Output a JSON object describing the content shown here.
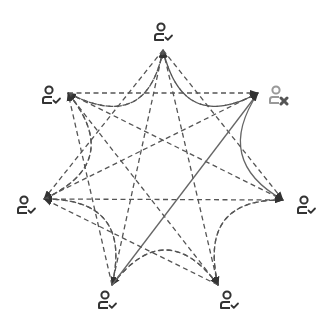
{
  "diagram": {
    "type": "network-graph",
    "colors": {
      "background": "#ffffff",
      "edge_dashed": "#555555",
      "edge_solid": "#666666",
      "node_icon": "#333333",
      "node_icon_disconnected": "#999999",
      "disconnect_mark": "#555555"
    },
    "nodes": [
      {
        "id": "n0",
        "icon": "user-check-icon",
        "status": "connected",
        "x": 163,
        "y": 32,
        "tip": [
          163,
          50
        ]
      },
      {
        "id": "n1",
        "icon": "user-x-icon",
        "status": "disconnected",
        "x": 278,
        "y": 95,
        "tip": [
          258,
          93
        ]
      },
      {
        "id": "n2",
        "icon": "user-check-icon",
        "status": "connected",
        "x": 306,
        "y": 205,
        "tip": [
          283,
          200
        ]
      },
      {
        "id": "n3",
        "icon": "user-check-icon",
        "status": "connected",
        "x": 229,
        "y": 300,
        "tip": [
          218,
          285
        ]
      },
      {
        "id": "n4",
        "icon": "user-check-icon",
        "status": "connected",
        "x": 107,
        "y": 300,
        "tip": [
          112,
          285
        ]
      },
      {
        "id": "n5",
        "icon": "user-check-icon",
        "status": "connected",
        "x": 26,
        "y": 205,
        "tip": [
          44,
          199
        ]
      },
      {
        "id": "n6",
        "icon": "user-check-icon",
        "status": "connected",
        "x": 51,
        "y": 95,
        "tip": [
          68,
          93
        ]
      }
    ],
    "edges": [
      {
        "from": "n0",
        "to": "n1",
        "style": "dashed",
        "shape": "curve"
      },
      {
        "from": "n1",
        "to": "n0",
        "style": "dashed",
        "shape": "curve"
      },
      {
        "from": "n6",
        "to": "n0",
        "style": "dashed",
        "shape": "curve"
      },
      {
        "from": "n0",
        "to": "n6",
        "style": "dashed",
        "shape": "curve"
      },
      {
        "from": "n6",
        "to": "n5",
        "style": "dashed",
        "shape": "curve"
      },
      {
        "from": "n5",
        "to": "n6",
        "style": "dashed",
        "shape": "curve"
      },
      {
        "from": "n5",
        "to": "n4",
        "style": "dashed",
        "shape": "curve"
      },
      {
        "from": "n4",
        "to": "n5",
        "style": "dashed",
        "shape": "curve"
      },
      {
        "from": "n4",
        "to": "n3",
        "style": "dashed",
        "shape": "curve"
      },
      {
        "from": "n3",
        "to": "n4",
        "style": "dashed",
        "shape": "curve"
      },
      {
        "from": "n3",
        "to": "n2",
        "style": "dashed",
        "shape": "curve"
      },
      {
        "from": "n2",
        "to": "n3",
        "style": "dashed",
        "shape": "curve"
      },
      {
        "from": "n1",
        "to": "n2",
        "style": "solid",
        "shape": "curve"
      },
      {
        "from": "n0",
        "to": "n2",
        "style": "dashed",
        "shape": "straight"
      },
      {
        "from": "n0",
        "to": "n5",
        "style": "dashed",
        "shape": "straight"
      },
      {
        "from": "n0",
        "to": "n3",
        "style": "dashed",
        "shape": "straight"
      },
      {
        "from": "n0",
        "to": "n4",
        "style": "dashed",
        "shape": "straight"
      },
      {
        "from": "n6",
        "to": "n1",
        "style": "dashed",
        "shape": "straight"
      },
      {
        "from": "n6",
        "to": "n3",
        "style": "dashed",
        "shape": "straight"
      },
      {
        "from": "n6",
        "to": "n2",
        "style": "dashed",
        "shape": "straight"
      },
      {
        "from": "n5",
        "to": "n1",
        "style": "dashed",
        "shape": "straight"
      },
      {
        "from": "n5",
        "to": "n2",
        "style": "dashed",
        "shape": "straight"
      },
      {
        "from": "n4",
        "to": "n1",
        "style": "solid",
        "shape": "straight"
      },
      {
        "from": "n4",
        "to": "n6",
        "style": "dashed",
        "shape": "straight"
      },
      {
        "from": "n3",
        "to": "n5",
        "style": "dashed",
        "shape": "straight"
      }
    ]
  }
}
